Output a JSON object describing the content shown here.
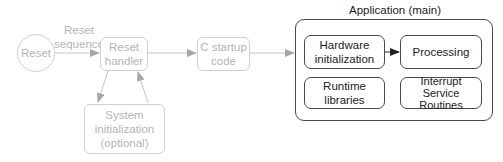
{
  "diagram": {
    "title": "Application (main)",
    "edge_labels": {
      "reset_sequence_line1": "Reset",
      "reset_sequence_line2": "sequence"
    },
    "nodes": {
      "reset": {
        "label": "Reset",
        "style": "faded",
        "shape": "circle"
      },
      "reset_handler": {
        "line1": "Reset",
        "line2": "handler",
        "style": "faded"
      },
      "c_startup": {
        "line1": "C startup",
        "line2": "code",
        "style": "faded"
      },
      "system_init": {
        "line1": "System",
        "line2": "initialization",
        "line3": "(optional)",
        "style": "faded"
      },
      "hardware_init": {
        "line1": "Hardware",
        "line2": "initialization",
        "style": "solid"
      },
      "processing": {
        "label": "Processing",
        "style": "solid"
      },
      "runtime_libs": {
        "line1": "Runtime",
        "line2": "libraries",
        "style": "solid"
      },
      "isr": {
        "line1": "Interrupt",
        "line2": "Service",
        "line3": "Routines",
        "style": "solid"
      }
    },
    "edges": [
      {
        "from": "reset",
        "to": "reset_handler",
        "label": "Reset sequence"
      },
      {
        "from": "reset_handler",
        "to": "c_startup"
      },
      {
        "from": "reset_handler",
        "to": "system_init"
      },
      {
        "from": "system_init",
        "to": "reset_handler"
      },
      {
        "from": "c_startup",
        "to": "application"
      },
      {
        "from": "hardware_init",
        "to": "processing"
      }
    ],
    "colors": {
      "faded_stroke": "#cfcfcf",
      "faded_text": "#b4b4b4",
      "faded_arrow": "#a8a8a8",
      "solid_stroke": "#4a4a4a",
      "solid_text": "#222222",
      "solid_arrow": "#222222"
    }
  }
}
